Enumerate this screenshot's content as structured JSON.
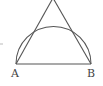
{
  "diagram": {
    "type": "geometry",
    "points": {
      "A": {
        "label": "A",
        "x": 16,
        "y": 64
      },
      "B": {
        "label": "B",
        "x": 91,
        "y": 64
      },
      "apex": {
        "x": 53,
        "y": -2
      }
    },
    "arc": {
      "center_x": 53.5,
      "center_y": 64,
      "radius": 37.5
    },
    "stroke_color": "#555555",
    "label_color": "#444444"
  }
}
